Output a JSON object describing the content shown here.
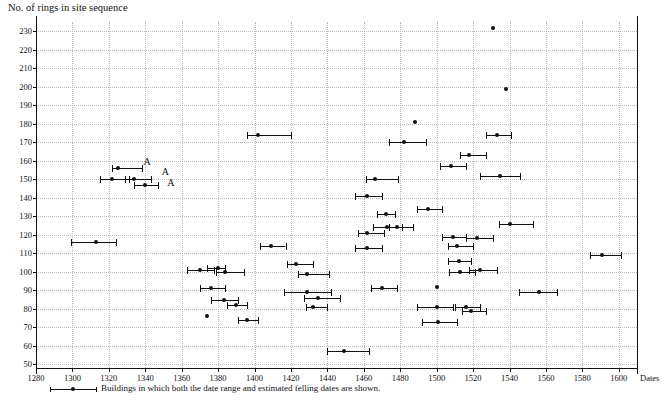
{
  "chart_data": {
    "type": "scatter",
    "title": "",
    "ylabel": "No. of rings in site sequence",
    "xlabel": "Dates",
    "xlim": [
      1280,
      1610
    ],
    "ylim": [
      48,
      235
    ],
    "xticks": [
      1280,
      1300,
      1320,
      1340,
      1360,
      1380,
      1400,
      1420,
      1440,
      1460,
      1480,
      1500,
      1520,
      1540,
      1560,
      1580,
      1600
    ],
    "yticks": [
      50,
      60,
      70,
      80,
      90,
      100,
      110,
      120,
      130,
      140,
      150,
      160,
      170,
      180,
      190,
      200,
      210,
      220,
      230
    ],
    "grid": true,
    "legend": {
      "position": "below-axis",
      "entries": [
        "Buildings in which both the date range and estimated felling dates are shown."
      ]
    },
    "annotations": [
      {
        "text": "A",
        "x": 1339,
        "y": 158
      },
      {
        "text": "A",
        "x": 1349,
        "y": 153
      },
      {
        "text": "A",
        "x": 1352,
        "y": 147
      }
    ],
    "points": [
      {
        "x": 1325,
        "y": 156,
        "x_low": 1322,
        "x_high": 1338
      },
      {
        "x": 1322,
        "y": 150,
        "x_low": 1315,
        "x_high": 1331
      },
      {
        "x": 1334,
        "y": 150,
        "x_low": 1329,
        "x_high": 1343
      },
      {
        "x": 1340,
        "y": 147,
        "x_low": 1334,
        "x_high": 1347
      },
      {
        "x": 1313,
        "y": 116,
        "x_low": 1299,
        "x_high": 1324
      },
      {
        "x": 1370,
        "y": 101,
        "x_low": 1363,
        "x_high": 1378
      },
      {
        "x": 1380,
        "y": 102,
        "x_low": 1374,
        "x_high": 1384
      },
      {
        "x": 1384,
        "y": 100,
        "x_low": 1379,
        "x_high": 1394
      },
      {
        "x": 1376,
        "y": 91,
        "x_low": 1370,
        "x_high": 1384
      },
      {
        "x": 1383,
        "y": 85,
        "x_low": 1376,
        "x_high": 1391
      },
      {
        "x": 1390,
        "y": 82,
        "x_low": 1385,
        "x_high": 1396
      },
      {
        "x": 1374,
        "y": 76,
        "x_low": 1374,
        "x_high": 1374
      },
      {
        "x": 1396,
        "y": 74,
        "x_low": 1391,
        "x_high": 1402
      },
      {
        "x": 1402,
        "y": 174,
        "x_low": 1396,
        "x_high": 1420
      },
      {
        "x": 1409,
        "y": 114,
        "x_low": 1403,
        "x_high": 1417
      },
      {
        "x": 1423,
        "y": 104,
        "x_low": 1418,
        "x_high": 1432
      },
      {
        "x": 1429,
        "y": 99,
        "x_low": 1424,
        "x_high": 1441
      },
      {
        "x": 1429,
        "y": 89,
        "x_low": 1416,
        "x_high": 1442
      },
      {
        "x": 1435,
        "y": 86,
        "x_low": 1427,
        "x_high": 1447
      },
      {
        "x": 1432,
        "y": 81,
        "x_low": 1428,
        "x_high": 1440
      },
      {
        "x": 1449,
        "y": 57,
        "x_low": 1440,
        "x_high": 1463
      },
      {
        "x": 1462,
        "y": 141,
        "x_low": 1455,
        "x_high": 1470
      },
      {
        "x": 1466,
        "y": 150,
        "x_low": 1461,
        "x_high": 1479
      },
      {
        "x": 1472,
        "y": 131,
        "x_low": 1467,
        "x_high": 1477
      },
      {
        "x": 1473,
        "y": 124,
        "x_low": 1465,
        "x_high": 1481
      },
      {
        "x": 1478,
        "y": 124,
        "x_low": 1474,
        "x_high": 1487
      },
      {
        "x": 1462,
        "y": 121,
        "x_low": 1457,
        "x_high": 1471
      },
      {
        "x": 1462,
        "y": 113,
        "x_low": 1455,
        "x_high": 1470
      },
      {
        "x": 1470,
        "y": 91,
        "x_low": 1464,
        "x_high": 1478
      },
      {
        "x": 1482,
        "y": 170,
        "x_low": 1474,
        "x_high": 1494
      },
      {
        "x": 1488,
        "y": 181,
        "x_low": 1488,
        "x_high": 1488
      },
      {
        "x": 1495,
        "y": 134,
        "x_low": 1489,
        "x_high": 1503
      },
      {
        "x": 1500,
        "y": 92,
        "x_low": 1500,
        "x_high": 1500
      },
      {
        "x": 1500,
        "y": 81,
        "x_low": 1489,
        "x_high": 1509
      },
      {
        "x": 1501,
        "y": 73,
        "x_low": 1492,
        "x_high": 1511
      },
      {
        "x": 1508,
        "y": 157,
        "x_low": 1502,
        "x_high": 1516
      },
      {
        "x": 1509,
        "y": 119,
        "x_low": 1503,
        "x_high": 1516
      },
      {
        "x": 1511,
        "y": 114,
        "x_low": 1506,
        "x_high": 1520
      },
      {
        "x": 1512,
        "y": 106,
        "x_low": 1506,
        "x_high": 1519
      },
      {
        "x": 1513,
        "y": 100,
        "x_low": 1507,
        "x_high": 1521
      },
      {
        "x": 1516,
        "y": 81,
        "x_low": 1510,
        "x_high": 1524
      },
      {
        "x": 1519,
        "y": 79,
        "x_low": 1514,
        "x_high": 1527
      },
      {
        "x": 1518,
        "y": 163,
        "x_low": 1513,
        "x_high": 1527
      },
      {
        "x": 1522,
        "y": 118,
        "x_low": 1516,
        "x_high": 1531
      },
      {
        "x": 1524,
        "y": 101,
        "x_low": 1518,
        "x_high": 1533
      },
      {
        "x": 1531,
        "y": 232,
        "x_low": 1531,
        "x_high": 1531
      },
      {
        "x": 1533,
        "y": 174,
        "x_low": 1527,
        "x_high": 1541
      },
      {
        "x": 1535,
        "y": 152,
        "x_low": 1524,
        "x_high": 1546
      },
      {
        "x": 1540,
        "y": 126,
        "x_low": 1534,
        "x_high": 1553
      },
      {
        "x": 1538,
        "y": 199,
        "x_low": 1538,
        "x_high": 1538
      },
      {
        "x": 1556,
        "y": 89,
        "x_low": 1545,
        "x_high": 1566
      },
      {
        "x": 1591,
        "y": 109,
        "x_low": 1584,
        "x_high": 1601
      }
    ]
  }
}
